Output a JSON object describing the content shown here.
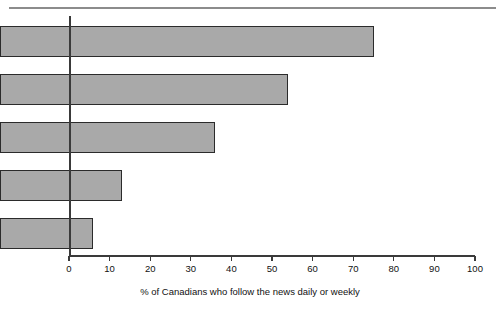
{
  "chart_data": {
    "type": "bar",
    "orientation": "horizontal",
    "title": "",
    "subtitle": "",
    "xlabel": "% of Canadians who follow the news daily or weekly",
    "ylabel": "",
    "categories": [
      "Television",
      "Newspaper",
      "Radio",
      "Internet",
      "Magazines"
    ],
    "values": [
      92,
      71,
      53,
      30,
      23
    ],
    "xlim": [
      0,
      100
    ],
    "xticks": [
      0,
      10,
      20,
      30,
      40,
      50,
      60,
      70,
      80,
      90,
      100
    ],
    "xtick_labels": [
      "0",
      "10",
      "20",
      "30",
      "40",
      "50",
      "60",
      "70",
      "80",
      "90",
      "100"
    ],
    "grid": false,
    "legend": null,
    "legend_position": "none",
    "series": [
      {
        "name": "% of Canadians who follow the news daily or weekly",
        "values": [
          92,
          71,
          53,
          30,
          23
        ]
      }
    ],
    "bar_fill_color": "#a9a9a9",
    "bar_border_color": "#2b2b2b",
    "axis_color": "#3a3a3a",
    "rule_color": "#8c8c8c",
    "background_color": "#ffffff",
    "text_color": "#111111"
  }
}
